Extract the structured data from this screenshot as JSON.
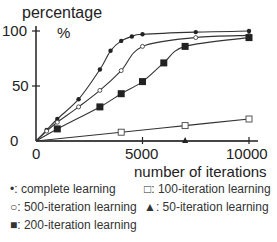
{
  "chart_data": {
    "type": "line",
    "title": "",
    "ylabel": "percentage %",
    "xlabel": "number of iterations",
    "xlim": [
      0,
      10000
    ],
    "ylim": [
      0,
      100
    ],
    "xticks": [
      0,
      5000,
      10000
    ],
    "yticks": [
      0,
      50,
      100
    ],
    "grid": false,
    "legend_position": "bottom",
    "series": [
      {
        "name": "complete learning",
        "marker": "filled-circle",
        "x": [
          0,
          500,
          1000,
          2000,
          3000,
          3500,
          4000,
          4500,
          5000,
          7500,
          10000
        ],
        "y": [
          0,
          10,
          20,
          38,
          65,
          82,
          91,
          95,
          97,
          99,
          100
        ]
      },
      {
        "name": "500-iteration learning",
        "marker": "open-circle",
        "x": [
          0,
          500,
          1000,
          2000,
          3000,
          4000,
          5000,
          7500,
          10000
        ],
        "y": [
          0,
          9,
          17,
          31,
          46,
          64,
          86,
          94,
          96
        ]
      },
      {
        "name": "200-iteration learning",
        "marker": "filled-square",
        "x": [
          0,
          1000,
          3000,
          4000,
          5000,
          6000,
          7000,
          10000
        ],
        "y": [
          0,
          11,
          31,
          43,
          54,
          71,
          86,
          94
        ]
      },
      {
        "name": "100-iteration learning",
        "marker": "open-square",
        "x": [
          0,
          4000,
          7000,
          10000
        ],
        "y": [
          0,
          8,
          14,
          20
        ]
      },
      {
        "name": "50-iteration learning",
        "marker": "filled-triangle",
        "x": [
          0,
          7000,
          10000
        ],
        "y": [
          0,
          0,
          0
        ]
      }
    ]
  },
  "labels": {
    "ylabel_top": "percentage",
    "ylabel_unit": "%",
    "xlabel": "number of iterations",
    "y0": "0",
    "y50": "50",
    "y100": "100",
    "x0": "0",
    "x5000": "5000",
    "x10000": "10000"
  },
  "legend": [
    {
      "symbol": "•:",
      "label": "complete learning"
    },
    {
      "symbol": "○:",
      "label": "500-iteration learning"
    },
    {
      "symbol": "■:",
      "label": "200-iteration learning"
    },
    {
      "symbol": "□:",
      "label": "100-iteration learning"
    },
    {
      "symbol": "▲:",
      "label": "50-iteration learning"
    }
  ]
}
